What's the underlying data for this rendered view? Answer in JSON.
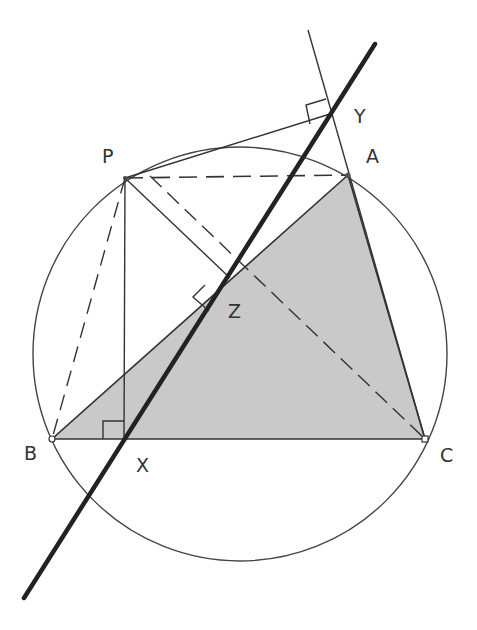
{
  "colors": {
    "line": "#333333",
    "fill": "#c8c8c8",
    "simson": "#222222"
  },
  "labels": {
    "P": "P",
    "A": "A",
    "B": "B",
    "C": "C",
    "X": "X",
    "Y": "Y",
    "Z": "Z"
  },
  "points": {
    "P": [
      125,
      178
    ],
    "A": [
      348,
      175
    ],
    "B": [
      52,
      439
    ],
    "C": [
      425,
      439
    ],
    "X": [
      124,
      439
    ],
    "Y": [
      330,
      114
    ],
    "Z": [
      230,
      278
    ]
  },
  "circle": {
    "cx": 240,
    "cy": 354,
    "r": 207
  }
}
